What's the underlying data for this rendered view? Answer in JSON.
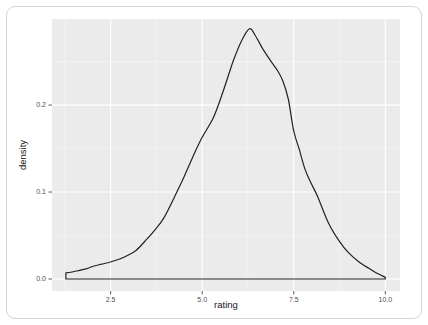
{
  "window": {
    "background": "#ffffff"
  },
  "chart_data": {
    "type": "area",
    "subtype": "kernel-density-curve",
    "title": "",
    "xlabel": "rating",
    "ylabel": "density",
    "x_ticks": {
      "values": [
        2.5,
        5.0,
        7.5,
        10.0
      ],
      "labels": [
        "2.5",
        "5.0",
        "7.5",
        "10.0"
      ]
    },
    "y_ticks": {
      "values": [
        0.0,
        0.1,
        0.2
      ],
      "labels": [
        "0.0",
        "0.1",
        "0.2"
      ]
    },
    "x_minor_ticks": [
      1.25,
      3.75,
      6.25,
      8.75
    ],
    "y_minor_ticks": [
      0.05,
      0.15,
      0.25
    ],
    "xlim": [
      0.9,
      10.4
    ],
    "ylim": [
      -0.0138,
      0.299
    ],
    "grid": {
      "major": true,
      "minor": true
    },
    "legend": "none",
    "series": [
      {
        "name": "density(rating)",
        "closed_to_baseline": true,
        "baseline": 0,
        "fill": "none",
        "points": [
          [
            1.28,
            0.007
          ],
          [
            1.45,
            0.008
          ],
          [
            1.65,
            0.01
          ],
          [
            1.85,
            0.012
          ],
          [
            2.05,
            0.015
          ],
          [
            2.25,
            0.017
          ],
          [
            2.45,
            0.019
          ],
          [
            2.75,
            0.023
          ],
          [
            3.0,
            0.028
          ],
          [
            3.2,
            0.033
          ],
          [
            3.45,
            0.044
          ],
          [
            3.7,
            0.056
          ],
          [
            3.95,
            0.07
          ],
          [
            4.25,
            0.095
          ],
          [
            4.5,
            0.117
          ],
          [
            4.75,
            0.141
          ],
          [
            5.0,
            0.163
          ],
          [
            5.3,
            0.185
          ],
          [
            5.55,
            0.213
          ],
          [
            5.85,
            0.251
          ],
          [
            6.1,
            0.276
          ],
          [
            6.3,
            0.288
          ],
          [
            6.45,
            0.28
          ],
          [
            6.65,
            0.265
          ],
          [
            6.85,
            0.252
          ],
          [
            7.05,
            0.24
          ],
          [
            7.2,
            0.228
          ],
          [
            7.35,
            0.207
          ],
          [
            7.5,
            0.17
          ],
          [
            7.65,
            0.149
          ],
          [
            7.8,
            0.127
          ],
          [
            7.95,
            0.112
          ],
          [
            8.15,
            0.095
          ],
          [
            8.45,
            0.064
          ],
          [
            8.75,
            0.043
          ],
          [
            9.0,
            0.03
          ],
          [
            9.3,
            0.019
          ],
          [
            9.6,
            0.011
          ],
          [
            9.8,
            0.006
          ],
          [
            10.0,
            0.002
          ]
        ]
      }
    ],
    "colors": {
      "panel_background": "#ebebeb",
      "grid_major": "#ffffff",
      "grid_minor": "#f6f6f6",
      "curve_line": "#222222",
      "tick_mark": "#333333",
      "tick_label": "#4f4f4f",
      "axis_title": "#151515",
      "card_border": "#d4d4d4",
      "page_background": "#ffffff"
    }
  }
}
